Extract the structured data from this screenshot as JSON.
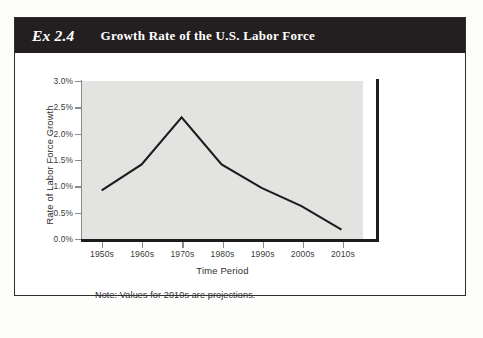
{
  "exhibit": {
    "number_label": "Ex 2.4",
    "title": "Growth Rate of the U.S. Labor Force"
  },
  "colors": {
    "header_background": "#231f20",
    "header_text": "#ffffff",
    "card_border": "#2e2e2e",
    "plot_background": "#e3e3e1",
    "series_line": "#1c1c1c",
    "axis_line": "#8a8a8a",
    "page_background": "#ffffff"
  },
  "note": {
    "text": "Note: Values for 2010s are projections."
  },
  "chart_data": {
    "type": "line",
    "title": "Growth Rate of the U.S. Labor Force",
    "subtitle": "",
    "xlabel": "Time Period",
    "ylabel": "Rate of Labor Force Growth",
    "categories": [
      "1950s",
      "1960s",
      "1970s",
      "1980s",
      "1990s",
      "2000s",
      "2010s"
    ],
    "values": [
      0.9,
      1.4,
      2.3,
      1.4,
      0.95,
      0.6,
      0.15
    ],
    "value_unit": "%",
    "ylim": [
      0.0,
      3.0
    ],
    "ytick_values": [
      0.0,
      0.5,
      1.0,
      1.5,
      2.0,
      2.5,
      3.0
    ],
    "ytick_labels": [
      "0.0%",
      "0.5%",
      "1.0%",
      "1.5%",
      "2.0%",
      "2.5%",
      "3.0%"
    ],
    "grid": false,
    "legend": false,
    "legend_position": "none",
    "annotations": [
      "Note: Values for 2010s are projections."
    ],
    "series": [
      {
        "name": "Rate of Labor Force Growth",
        "values": [
          0.9,
          1.4,
          2.3,
          1.4,
          0.95,
          0.6,
          0.15
        ]
      }
    ]
  }
}
